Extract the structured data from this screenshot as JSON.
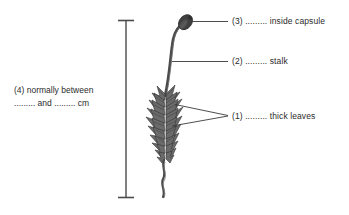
{
  "figure": {
    "background_color": "#ffffff",
    "ink_color": "#3a3a3a"
  },
  "scale_bar": {
    "name": "height-measurement-bar",
    "orientation": "vertical",
    "top_y": 20,
    "bottom_y": 198,
    "x": 126
  },
  "labels": [
    {
      "id": "label-1",
      "number": "(1)",
      "blank": ".........",
      "text": "thick leaves",
      "full": "(1) ......... thick leaves",
      "x": 232,
      "y": 113
    },
    {
      "id": "label-2",
      "number": "(2)",
      "blank": ".........",
      "text": "stalk",
      "full": "(2) ......... stalk",
      "x": 232,
      "y": 56
    },
    {
      "id": "label-3",
      "number": "(3)",
      "blank": ".........",
      "text": "inside capsule",
      "full": "(3) ......... inside capsule",
      "x": 232,
      "y": 18
    }
  ],
  "note": {
    "id": "label-4",
    "number": "(4)",
    "line1": "(4) normally between",
    "line2_blank_a": ".........",
    "line2_mid": "and",
    "line2_blank_b": ".........",
    "line2_unit": "cm",
    "line2": "......... and ......... cm"
  },
  "plant": {
    "capsule_label": "capsule",
    "stalk_label": "stalk",
    "leaves_label": "thick leaves",
    "base_label": "rhizoid base"
  }
}
